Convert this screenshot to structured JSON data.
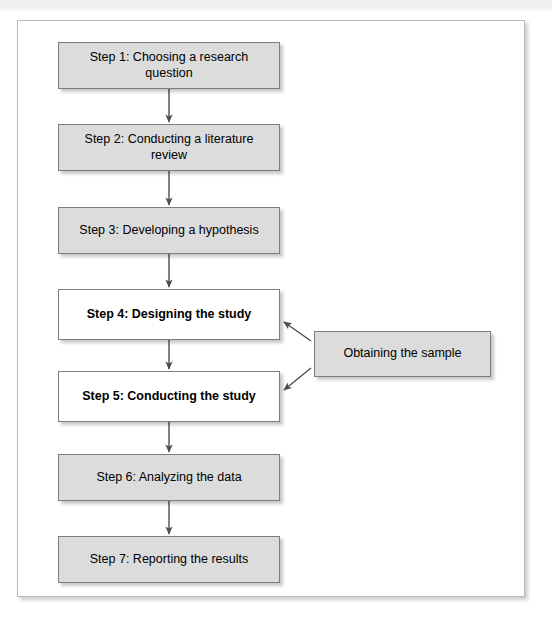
{
  "page": {
    "header_strip_text": "",
    "background_color": "#ffffff",
    "frame_border_color": "#b9b9b9"
  },
  "figure": {
    "title": "",
    "type": "flowchart",
    "orientation": "top-to-bottom",
    "shaded_node_color": "#dcdcdc",
    "plain_node_color": "#ffffff",
    "node_border_color": "#7d7d7d",
    "connector_color": "#4d4d4d"
  },
  "nodes": [
    {
      "id": "step1",
      "label": "Step 1: Choosing a research question",
      "style": "shaded",
      "emphasis": "normal"
    },
    {
      "id": "step2",
      "label": "Step 2: Conducting a literature review",
      "style": "shaded",
      "emphasis": "normal"
    },
    {
      "id": "step3",
      "label": "Step 3: Developing a hypothesis",
      "style": "shaded",
      "emphasis": "normal"
    },
    {
      "id": "step4",
      "label": "Step 4: Designing the study",
      "style": "plain",
      "emphasis": "bold"
    },
    {
      "id": "step5",
      "label": "Step 5: Conducting the study",
      "style": "plain",
      "emphasis": "bold"
    },
    {
      "id": "step6",
      "label": "Step 6: Analyzing the data",
      "style": "shaded",
      "emphasis": "normal"
    },
    {
      "id": "step7",
      "label": "Step 7: Reporting the results",
      "style": "shaded",
      "emphasis": "normal"
    },
    {
      "id": "sample",
      "label": "Obtaining the sample",
      "style": "shaded",
      "emphasis": "normal"
    }
  ],
  "edges": [
    {
      "from": "step1",
      "to": "step2",
      "kind": "vertical-arrow"
    },
    {
      "from": "step2",
      "to": "step3",
      "kind": "vertical-arrow"
    },
    {
      "from": "step3",
      "to": "step4",
      "kind": "vertical-arrow"
    },
    {
      "from": "step4",
      "to": "step5",
      "kind": "vertical-arrow"
    },
    {
      "from": "step5",
      "to": "step6",
      "kind": "vertical-arrow"
    },
    {
      "from": "step6",
      "to": "step7",
      "kind": "vertical-arrow"
    },
    {
      "from": "sample",
      "to": "step4",
      "kind": "diagonal-arrow"
    },
    {
      "from": "sample",
      "to": "step5",
      "kind": "diagonal-arrow"
    }
  ]
}
